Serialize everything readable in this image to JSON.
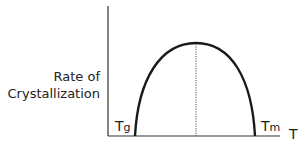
{
  "diagram": {
    "y_axis_label_line1": "Rate of",
    "y_axis_label_line2": "Crystallization",
    "x_axis_label": "T",
    "left_bound": {
      "base": "T",
      "subscript": "g"
    },
    "right_bound": {
      "base": "T",
      "subscript": "m"
    },
    "curve": "parabolic arch (rate of crystallization vs temperature), peak midway between Tg and Tm",
    "peak_marker": "dotted vertical line at maximum",
    "colors": {
      "line": "#1a1a1a",
      "axis": "#333333",
      "text": "#222222"
    }
  }
}
